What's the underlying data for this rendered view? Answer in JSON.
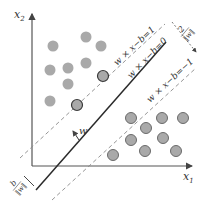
{
  "diagram": {
    "type": "svm-max-margin",
    "axes": {
      "x_label": "x",
      "x_sub": "1",
      "y_label": "x",
      "y_sub": "2"
    },
    "lines": {
      "upper_margin": "w × x−b=1",
      "hyperplane": "w × x−b=0",
      "lower_margin": "w × x−b=−1"
    },
    "annotations": {
      "normal_vector": "w",
      "margin_width_num": "2",
      "margin_width_den": "‖w‖",
      "offset_num": "b",
      "offset_den": "‖w‖"
    },
    "colors": {
      "point_fill": "#a9a9a9",
      "point_stroke_b": "#6a6a6a",
      "support_stroke": "#3a3a3a",
      "axis": "#555555",
      "hyperplane": "#2a2a2a",
      "margin": "#8a8a8a"
    },
    "class_a_points": [
      [
        86,
        37
      ],
      [
        101,
        46
      ],
      [
        53,
        46
      ],
      [
        50,
        70
      ],
      [
        68,
        68
      ],
      [
        86,
        63
      ],
      [
        68,
        84
      ],
      [
        50,
        101
      ]
    ],
    "class_a_support": [
      [
        103,
        76
      ],
      [
        77,
        105
      ]
    ],
    "class_b_points": [
      [
        131,
        118
      ],
      [
        146,
        128
      ],
      [
        131,
        140
      ],
      [
        145,
        151
      ],
      [
        162,
        118
      ],
      [
        163,
        138
      ],
      [
        176,
        151
      ],
      [
        183,
        118
      ],
      [
        113,
        155
      ]
    ]
  }
}
